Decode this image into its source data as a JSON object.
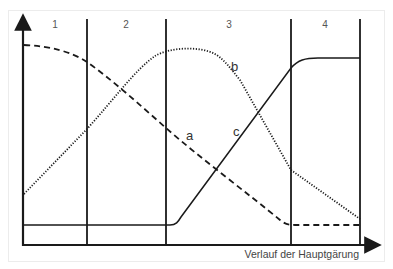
{
  "diagram": {
    "phases": [
      {
        "label": "1"
      },
      {
        "label": "2"
      },
      {
        "label": "3"
      },
      {
        "label": "4"
      }
    ],
    "curves": [
      {
        "label": "a",
        "style": "dashed"
      },
      {
        "label": "b",
        "style": "dotted"
      },
      {
        "label": "c",
        "style": "solid"
      }
    ],
    "x_axis_label": "Verlauf der Hauptgärung",
    "colors": {
      "line": "#1a1a1a",
      "text": "#555555"
    }
  }
}
